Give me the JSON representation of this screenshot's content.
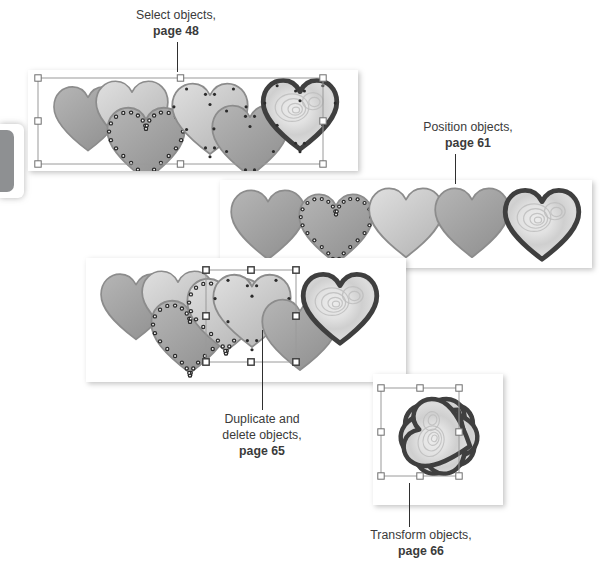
{
  "figure": {
    "kind": "instructional-diagram",
    "background": "#ffffff"
  },
  "edge_tab": {
    "name": "page-edge-tab",
    "color": "#8e9092",
    "x": 0,
    "y": 130,
    "w": 14,
    "h": 62
  },
  "callouts": [
    {
      "id": "select-objects",
      "line1": "Select objects,",
      "page": "page 48",
      "text_x": 96,
      "text_y": 8,
      "text_w": 160,
      "leader": {
        "x": 177,
        "y": 42,
        "h": 30
      }
    },
    {
      "id": "position-objects",
      "line1": "Position objects,",
      "page": "page 61",
      "text_x": 388,
      "text_y": 120,
      "text_w": 160,
      "leader": {
        "x": 455,
        "y": 154,
        "h": 30
      }
    },
    {
      "id": "duplicate-delete-objects",
      "line1": "Duplicate and",
      "line2": "delete objects,",
      "page": "page 65",
      "text_x": 182,
      "text_y": 412,
      "text_w": 160,
      "leader": {
        "x": 262,
        "y": 330,
        "h": 80
      }
    },
    {
      "id": "transform-objects",
      "line1": "Transform objects,",
      "page": "page 66",
      "text_x": 336,
      "text_y": 528,
      "text_w": 170,
      "leader": {
        "x": 409,
        "y": 483,
        "h": 44
      }
    }
  ],
  "panels": [
    {
      "id": "panel-select",
      "label": "selection-screenshot",
      "x": 28,
      "y": 70,
      "w": 330,
      "h": 101,
      "selection_box": {
        "x": 10,
        "y": 8,
        "w": 285,
        "h": 86,
        "handle_style": "hollow"
      },
      "hearts": [
        {
          "cx": 60,
          "cy": 48,
          "size": 74,
          "fill": "gradient-gray",
          "outline": "soft",
          "nodes": "none",
          "z": 2
        },
        {
          "cx": 104,
          "cy": 44,
          "size": 78,
          "fill": "gradient-light",
          "outline": "soft",
          "nodes": "none",
          "z": 3
        },
        {
          "cx": 118,
          "cy": 73,
          "size": 84,
          "fill": "gradient-gray",
          "outline": "soft",
          "nodes": "dots",
          "z": 4
        },
        {
          "cx": 182,
          "cy": 48,
          "size": 82,
          "fill": "gradient-light",
          "outline": "soft",
          "nodes": "small",
          "z": 5
        },
        {
          "cx": 222,
          "cy": 70,
          "size": 82,
          "fill": "gradient-gray",
          "outline": "soft",
          "nodes": "small",
          "z": 6
        },
        {
          "cx": 272,
          "cy": 44,
          "size": 80,
          "fill": "rose-texture",
          "outline": "thick",
          "nodes": "small",
          "z": 7
        }
      ]
    },
    {
      "id": "panel-position",
      "label": "position-screenshot",
      "x": 220,
      "y": 180,
      "w": 372,
      "h": 88,
      "selection_box": null,
      "hearts": [
        {
          "cx": 48,
          "cy": 44,
          "size": 80,
          "fill": "gradient-gray",
          "outline": "soft",
          "nodes": "none",
          "z": 2
        },
        {
          "cx": 116,
          "cy": 48,
          "size": 80,
          "fill": "gradient-gray",
          "outline": "soft",
          "nodes": "dots",
          "z": 3
        },
        {
          "cx": 186,
          "cy": 42,
          "size": 80,
          "fill": "gradient-light",
          "outline": "soft",
          "nodes": "none",
          "z": 4
        },
        {
          "cx": 252,
          "cy": 42,
          "size": 80,
          "fill": "gradient-gray",
          "outline": "soft",
          "nodes": "none",
          "z": 5
        },
        {
          "cx": 322,
          "cy": 44,
          "size": 80,
          "fill": "rose-texture",
          "outline": "thick",
          "nodes": "none",
          "z": 6
        }
      ]
    },
    {
      "id": "panel-duplicate",
      "label": "duplicate-delete-screenshot",
      "x": 86,
      "y": 258,
      "w": 320,
      "h": 124,
      "selection_box": {
        "x": 120,
        "y": 12,
        "w": 90,
        "h": 92,
        "handle_style": "filled"
      },
      "hearts": [
        {
          "cx": 50,
          "cy": 48,
          "size": 76,
          "fill": "gradient-gray",
          "outline": "soft",
          "nodes": "none",
          "z": 2
        },
        {
          "cx": 92,
          "cy": 46,
          "size": 78,
          "fill": "gradient-light",
          "outline": "soft",
          "nodes": "none",
          "z": 3
        },
        {
          "cx": 104,
          "cy": 78,
          "size": 84,
          "fill": "gradient-gray",
          "outline": "soft",
          "nodes": "dots",
          "z": 4
        },
        {
          "cx": 140,
          "cy": 56,
          "size": 84,
          "fill": "gradient-light",
          "outline": "soft",
          "nodes": "dots",
          "z": 5
        },
        {
          "cx": 166,
          "cy": 52,
          "size": 84,
          "fill": "gradient-light",
          "outline": "soft",
          "nodes": "small",
          "z": 6
        },
        {
          "cx": 214,
          "cy": 76,
          "size": 82,
          "fill": "gradient-gray",
          "outline": "soft",
          "nodes": "none",
          "z": 7
        },
        {
          "cx": 254,
          "cy": 50,
          "size": 80,
          "fill": "rose-texture",
          "outline": "thick",
          "nodes": "none",
          "z": 8
        }
      ]
    },
    {
      "id": "panel-transform",
      "label": "transform-screenshot",
      "x": 373,
      "y": 374,
      "w": 130,
      "h": 131,
      "selection_box": {
        "x": 8,
        "y": 14,
        "w": 78,
        "h": 88,
        "handle_style": "hollow"
      },
      "arrangement": "radial-flower",
      "petal_count": 5,
      "hearts": [
        {
          "cx": 66,
          "cy": 62,
          "size": 74,
          "fill": "rose-texture",
          "outline": "thick",
          "rotate": 0,
          "z": 2
        },
        {
          "cx": 66,
          "cy": 62,
          "size": 74,
          "fill": "rose-texture",
          "outline": "thick",
          "rotate": 72,
          "z": 3
        },
        {
          "cx": 66,
          "cy": 62,
          "size": 74,
          "fill": "rose-texture",
          "outline": "thick",
          "rotate": 144,
          "z": 4
        },
        {
          "cx": 66,
          "cy": 62,
          "size": 74,
          "fill": "rose-texture",
          "outline": "thick",
          "rotate": 216,
          "z": 5
        },
        {
          "cx": 66,
          "cy": 62,
          "size": 74,
          "fill": "rose-texture",
          "outline": "thick",
          "rotate": 288,
          "z": 6
        }
      ]
    }
  ],
  "colors": {
    "text": "#3b3b3b",
    "leader_line": "#2f2f2f",
    "panel_bg": "#ffffff",
    "heart_light": "#dedede",
    "heart_mid": "#b4b4b4",
    "heart_dark": "#8f8f8f",
    "heart_outline_soft": "#8c8c8c",
    "heart_outline_thick": "#3f3f3f",
    "rose_light": "#ececec",
    "rose_mid": "#cfcfcf",
    "node_dot": "#2b2b2b",
    "selection_line": "#9a9a9a",
    "handle_fill": "#ffffff",
    "handle_stroke": "#6e6e6e",
    "edge_tab": "#8e9092"
  }
}
